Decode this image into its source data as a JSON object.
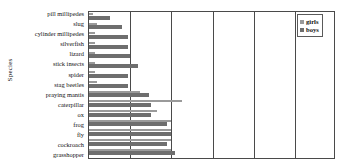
{
  "chart_data": {
    "type": "bar",
    "orientation": "horizontal",
    "title": "",
    "xlabel": "",
    "ylabel": "Species",
    "grid": true,
    "gridlines_x": [
      20,
      40,
      60,
      80,
      100
    ],
    "xlim": [
      0,
      120
    ],
    "legend_position": "top-right",
    "categories": [
      "pill millipedes",
      "slug",
      "cylinder millipedes",
      "silverfish",
      "lizard",
      "stick insects",
      "spider",
      "stag beetles",
      "praying mantis",
      "caterpillar",
      "ox",
      "frog",
      "fly",
      "cockroach",
      "grasshopper"
    ],
    "series": [
      {
        "name": "girls",
        "color": "#9a9a9a",
        "values": [
          2,
          4,
          3,
          3,
          3,
          3,
          3,
          4,
          25,
          45,
          33,
          40,
          40,
          40,
          40
        ]
      },
      {
        "name": "boys",
        "color": "#6e6e6e",
        "values": [
          10,
          16,
          19,
          19,
          20,
          24,
          19,
          19,
          29,
          30,
          30,
          38,
          40,
          38,
          42
        ]
      }
    ]
  },
  "legend": {
    "items": [
      {
        "label": "girls",
        "color": "#9a9a9a"
      },
      {
        "label": "boys",
        "color": "#6e6e6e"
      }
    ]
  }
}
